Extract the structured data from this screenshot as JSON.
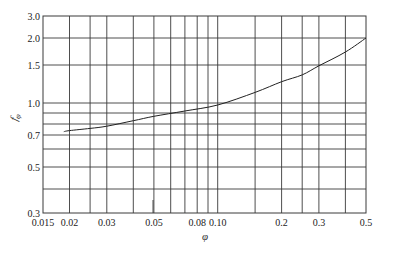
{
  "chart_data": {
    "type": "line",
    "title": "",
    "xlabel": "φ",
    "ylabel": "f_φ",
    "xscale": "log",
    "yscale": "custom-nonlinear",
    "xlim": [
      0.015,
      0.5
    ],
    "ylim": [
      0.3,
      3.0
    ],
    "grid": true,
    "legend": null,
    "x_ticks": [
      {
        "value": 0.015,
        "label": "0.015"
      },
      {
        "value": 0.02,
        "label": "0.02"
      },
      {
        "value": 0.03,
        "label": "0.03"
      },
      {
        "value": 0.05,
        "label": "0.05"
      },
      {
        "value": 0.08,
        "label": "0.08"
      },
      {
        "value": 0.1,
        "label": "0.10"
      },
      {
        "value": 0.2,
        "label": "0.2"
      },
      {
        "value": 0.3,
        "label": "0.3"
      },
      {
        "value": 0.5,
        "label": "0.5"
      }
    ],
    "x_gridlines": [
      0.02,
      0.025,
      0.03,
      0.04,
      0.05,
      0.06,
      0.07,
      0.08,
      0.09,
      0.1,
      0.15,
      0.2,
      0.25,
      0.3,
      0.4
    ],
    "y_ticks": [
      {
        "value": 3.0,
        "label": "3.0"
      },
      {
        "value": 2.0,
        "label": "2.0"
      },
      {
        "value": 1.5,
        "label": "1.5"
      },
      {
        "value": 1.0,
        "label": "1.0"
      },
      {
        "value": 0.7,
        "label": "0.7"
      },
      {
        "value": 0.5,
        "label": "0.5"
      },
      {
        "value": 0.3,
        "label": "0.3"
      }
    ],
    "y_gridlines": [
      2.0,
      1.5,
      1.0,
      0.9,
      0.8,
      0.7,
      0.6,
      0.5,
      0.4
    ],
    "y_scale_pixels": {
      "3.0": 16,
      "2.0": 38,
      "1.5": 65,
      "1.0": 103,
      "0.9": 113,
      "0.8": 124,
      "0.7": 135,
      "0.6": 149,
      "0.5": 167,
      "0.4": 189,
      "0.3": 213
    },
    "series": [
      {
        "name": "f_φ",
        "x": [
          0.0188,
          0.02,
          0.025,
          0.03,
          0.04,
          0.05,
          0.07,
          0.1,
          0.15,
          0.2,
          0.25,
          0.3,
          0.4,
          0.5
        ],
        "y": [
          0.73,
          0.74,
          0.76,
          0.78,
          0.83,
          0.87,
          0.92,
          0.98,
          1.14,
          1.28,
          1.37,
          1.49,
          1.74,
          2.0
        ]
      }
    ]
  }
}
